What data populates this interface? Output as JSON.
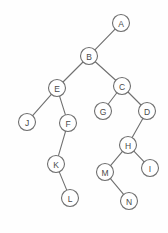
{
  "figure": {
    "background_color": "#fefefe",
    "stroke_color": "#6f6f6f",
    "node_fill_color": "#ffffff",
    "label_color": "#4a4a4a",
    "node_radius": 8.5,
    "width": 168,
    "height": 233
  },
  "chart_data": {
    "type": "diagram",
    "diagram_type": "binary-tree",
    "root": "A",
    "nodes": [
      {
        "id": "A",
        "label": "A",
        "x": 121,
        "y": 23
      },
      {
        "id": "B",
        "label": "B",
        "x": 89,
        "y": 56
      },
      {
        "id": "C",
        "label": "C",
        "x": 122,
        "y": 86
      },
      {
        "id": "E",
        "label": "E",
        "x": 57,
        "y": 88
      },
      {
        "id": "G",
        "label": "G",
        "x": 103,
        "y": 111
      },
      {
        "id": "D",
        "label": "D",
        "x": 147,
        "y": 111
      },
      {
        "id": "J",
        "label": "J",
        "x": 27,
        "y": 122
      },
      {
        "id": "F",
        "label": "F",
        "x": 68,
        "y": 123
      },
      {
        "id": "H",
        "label": "H",
        "x": 128,
        "y": 145
      },
      {
        "id": "K",
        "label": "K",
        "x": 56,
        "y": 164
      },
      {
        "id": "I",
        "label": "I",
        "x": 150,
        "y": 168
      },
      {
        "id": "M",
        "label": "M",
        "x": 105,
        "y": 172
      },
      {
        "id": "L",
        "label": "L",
        "x": 70,
        "y": 198
      },
      {
        "id": "N",
        "label": "N",
        "x": 129,
        "y": 201
      }
    ],
    "edges": [
      {
        "from": "A",
        "to": "B",
        "side": "left"
      },
      {
        "from": "B",
        "to": "E",
        "side": "left"
      },
      {
        "from": "B",
        "to": "C",
        "side": "right"
      },
      {
        "from": "E",
        "to": "J",
        "side": "left"
      },
      {
        "from": "E",
        "to": "F",
        "side": "right"
      },
      {
        "from": "F",
        "to": "K",
        "side": "left"
      },
      {
        "from": "K",
        "to": "L",
        "side": "right"
      },
      {
        "from": "C",
        "to": "G",
        "side": "left"
      },
      {
        "from": "C",
        "to": "D",
        "side": "right"
      },
      {
        "from": "D",
        "to": "H",
        "side": "left"
      },
      {
        "from": "H",
        "to": "M",
        "side": "left"
      },
      {
        "from": "H",
        "to": "I",
        "side": "right"
      },
      {
        "from": "M",
        "to": "N",
        "side": "right"
      }
    ]
  }
}
